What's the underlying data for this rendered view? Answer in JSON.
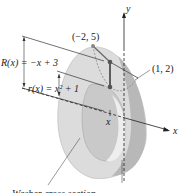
{
  "figure": {
    "type": "washer-method solid of revolution",
    "axes": {
      "x_label": "x",
      "y_label": "y"
    },
    "points": [
      {
        "label": "(−2, 5)"
      },
      {
        "label": "(1, 2)"
      }
    ],
    "functions": {
      "outer": "R(x) = −x + 3",
      "inner": "r(x) = x² + 1"
    },
    "marker_x": "x",
    "caption": "Washer cross section",
    "colors": {
      "solid_light": "#d9d9d9",
      "solid_mid": "#bdbdbd",
      "solid_dark": "#9a9a9a",
      "line": "#333333",
      "point": "#555555"
    }
  }
}
